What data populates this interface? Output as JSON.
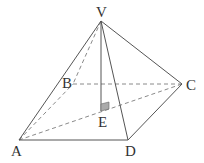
{
  "diagram": {
    "type": "square-based pyramid",
    "colors": {
      "line": "#555555",
      "dashed": "#888888",
      "fill": "#aaaaaa",
      "text": "#333333"
    },
    "points": {
      "V": {
        "label": "V",
        "x": 101,
        "y": 21
      },
      "A": {
        "label": "A",
        "x": 19,
        "y": 140
      },
      "B": {
        "label": "B",
        "x": 73,
        "y": 84
      },
      "C": {
        "label": "C",
        "x": 182,
        "y": 84
      },
      "D": {
        "label": "D",
        "x": 128,
        "y": 140
      },
      "E": {
        "label": "E",
        "x": 101,
        "y": 111
      }
    },
    "solid_edges": [
      "VA",
      "VC",
      "VD",
      "VE",
      "AD",
      "DC"
    ],
    "dashed_edges": [
      "VB",
      "AB",
      "BC",
      "AC"
    ],
    "right_angle_marker": "at E"
  }
}
